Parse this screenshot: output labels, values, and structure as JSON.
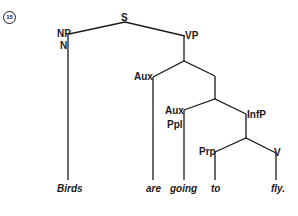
{
  "example_number": "15",
  "nodes": {
    "s": "S",
    "np": "NP",
    "n": "N",
    "vp": "VP",
    "aux1": "Aux",
    "aux2": "Aux",
    "ppl": "Ppl",
    "infp": "InfP",
    "prp": "Prp",
    "v": "V"
  },
  "leaves": [
    "Birds",
    "are",
    "going",
    "to",
    "fly."
  ],
  "colors": {
    "line": "#1a1a1a",
    "background": "#ffffff"
  }
}
